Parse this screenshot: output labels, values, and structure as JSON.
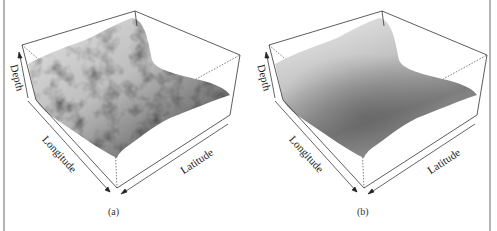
{
  "figure": {
    "panels": [
      {
        "id": "a",
        "caption": "(a)",
        "surface_style": "rough",
        "axes": {
          "depth": "Depth",
          "longitude": "Longitude",
          "latitude": "Latitude"
        }
      },
      {
        "id": "b",
        "caption": "(b)",
        "surface_style": "smooth",
        "axes": {
          "depth": "Depth",
          "longitude": "Longitude",
          "latitude": "Latitude"
        }
      }
    ],
    "colors": {
      "frame": "#b5b5b5",
      "box_edge": "#333333",
      "surface_light": "#d8d8d8",
      "surface_dark": "#555555"
    }
  }
}
